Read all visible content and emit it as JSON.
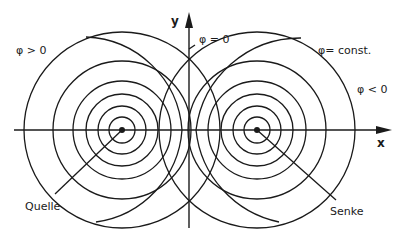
{
  "diagram": {
    "type": "potential-flow source/sink equipotential lines",
    "labels": {
      "y_axis": "y",
      "x_axis": "x",
      "phi_zero": "φ = 0",
      "phi_const": "φ= const.",
      "phi_positive": "φ > 0",
      "phi_negative": "φ < 0",
      "source": "Quelle",
      "sink": "Senke"
    },
    "source_center": [
      122,
      130
    ],
    "sink_center": [
      257,
      130
    ],
    "ring_radii": [
      13,
      24,
      36,
      49,
      69,
      98
    ],
    "outer_arc_radius": 112,
    "colors": {
      "line": "#1a1a1a",
      "background": "#ffffff"
    }
  }
}
